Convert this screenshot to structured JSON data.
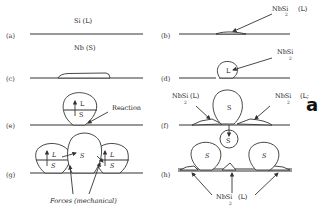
{
  "figure": {
    "panels": {
      "a": "(a)",
      "b": "(b)",
      "c": "(c)",
      "d": "(d)",
      "e": "(e)",
      "f": "(f)",
      "g": "(g)",
      "h": "(h)"
    },
    "labels": {
      "si_liquid": "Si (L)",
      "nb_solid": "Nb (S)",
      "nbsi": "NbSi",
      "sub2": "2",
      "liquid_paren": "(L)",
      "liquid_paren_cut": "(L;",
      "L": "L",
      "S": "S",
      "reaction": "Reaction",
      "forces": "Forces (mechanical)",
      "side_letter": "a"
    }
  }
}
